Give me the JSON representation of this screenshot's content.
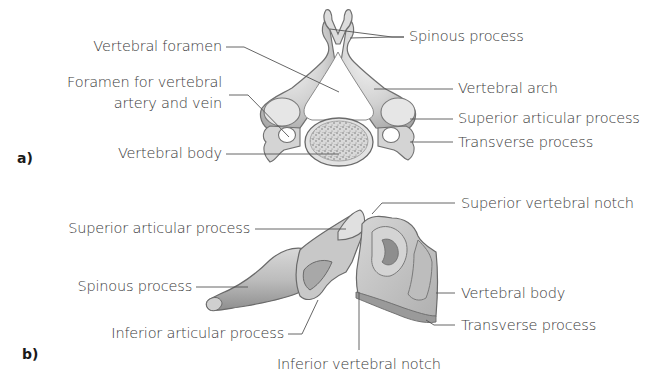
{
  "colors": {
    "background": "#ffffff",
    "text": "#3a3a3a",
    "leader_line": "#555555",
    "bone_light": "#e8e8e8",
    "bone_mid": "#c4c4c4",
    "bone_dark": "#8a8a8a",
    "bone_outline": "#6e6e6e",
    "body_texture": "#9a9a9a"
  },
  "panel_a": {
    "tag": "a)",
    "view": "superior",
    "labels": {
      "vertebral_foramen": "Vertebral foramen",
      "foramen_vertebral_artery_line1": "Foramen for vertebral",
      "foramen_vertebral_artery_line2": "artery and vein",
      "vertebral_body": "Vertebral body",
      "spinous_process": "Spinous process",
      "vertebral_arch": "Vertebral arch",
      "superior_articular_process": "Superior articular process",
      "transverse_process": "Transverse process"
    }
  },
  "panel_b": {
    "tag": "b)",
    "view": "lateral",
    "labels": {
      "superior_articular_process": "Superior articular process",
      "spinous_process": "Spinous process",
      "inferior_articular_process": "Inferior articular process",
      "inferior_vertebral_notch": "Inferior vertebral notch",
      "superior_vertebral_notch": "Superior vertebral notch",
      "vertebral_body": "Vertebral body",
      "transverse_process": "Transverse process"
    }
  }
}
